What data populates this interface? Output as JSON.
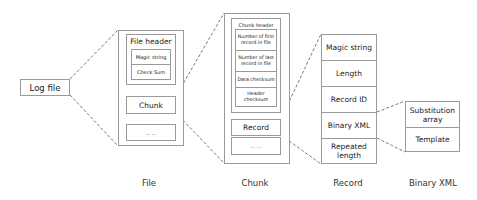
{
  "log_file": {
    "label": "Log file"
  },
  "file": {
    "header": {
      "title": "File header",
      "fields": [
        "Magic string",
        "Check Sum"
      ]
    },
    "chunk": "Chunk",
    "more": "... ..."
  },
  "chunk": {
    "header": {
      "title": "Chunk header",
      "fields": [
        "Number of first record in file",
        "Number of last record in file",
        "Data checksum",
        "Header checksum"
      ]
    },
    "record": "Record",
    "more": "... ..."
  },
  "record": {
    "fields": [
      "Magic string",
      "Length",
      "Record ID",
      "Binary XML",
      "Repeated length"
    ]
  },
  "binary_xml": {
    "fields": [
      "Substitution array",
      "Template"
    ]
  },
  "captions": {
    "file": "File",
    "chunk": "Chunk",
    "record": "Record",
    "binary_xml": "Binary XML"
  }
}
